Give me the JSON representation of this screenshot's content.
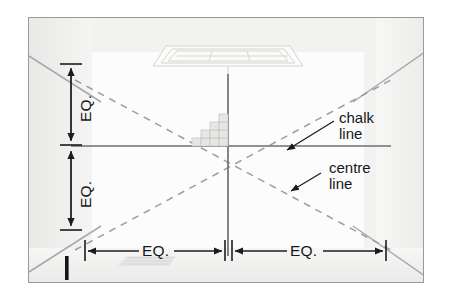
{
  "diagram": {
    "type": "construction-layout-plan",
    "frame": {
      "border_color": "#9a9a9a",
      "background_color": "#f2f2f1"
    },
    "colors": {
      "centre_line": "#6d6f72",
      "chalk_line": "#9a9c9f",
      "dimension_line": "#1b1c1e",
      "text": "#16171a",
      "wall_edge": "#a8a9ab",
      "tile_fill": "#e4e4e3",
      "tile_stroke": "#bdbdbc",
      "fixture_stroke": "#cfcfce"
    },
    "callouts": [
      {
        "id": "chalk-line",
        "line1": "chalk",
        "line2": "line"
      },
      {
        "id": "centre-line",
        "line1": "centre",
        "line2": "line"
      }
    ],
    "dimensions": {
      "horizontal": [
        {
          "id": "eq-bottom-left",
          "label": "EQ."
        },
        {
          "id": "eq-bottom-right",
          "label": "EQ."
        }
      ],
      "vertical": [
        {
          "id": "eq-left-upper",
          "label": "EQ."
        },
        {
          "id": "eq-left-lower",
          "label": "EQ."
        }
      ]
    },
    "elements": [
      {
        "id": "ceiling-light-fixture",
        "name": "recessed ceiling light fixture"
      },
      {
        "id": "tile-stair-pattern",
        "name": "stepped tile pattern at centre point"
      },
      {
        "id": "centre-point",
        "name": "intersection of centre lines"
      },
      {
        "id": "floor-marker-bar",
        "name": "black reference marker bar"
      },
      {
        "id": "floor-threshold",
        "name": "faint floor threshold strip"
      }
    ]
  }
}
